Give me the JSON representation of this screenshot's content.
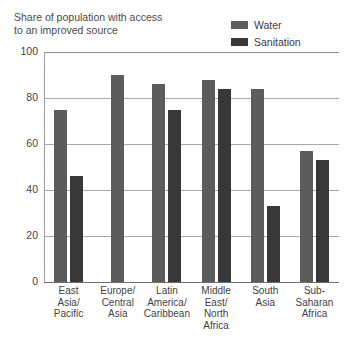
{
  "chart_data": {
    "type": "bar",
    "title": "Share of population with access\nto an improved source",
    "xlabel": "",
    "ylabel": "",
    "ylim": [
      0,
      100
    ],
    "yticks": [
      100,
      80,
      60,
      40,
      20,
      0
    ],
    "grid": true,
    "legend_position": "top-right",
    "categories": [
      "East\nAsia/\nPacific",
      "Europe/\nCentral\nAsia",
      "Latin\nAmerica/\nCaribbean",
      "Middle\nEast/\nNorth\nAfrica",
      "South\nAsia",
      "Sub-\nSaharan\nAfrica"
    ],
    "series": [
      {
        "name": "Water",
        "color": "#5c5c5c",
        "values": [
          75,
          90,
          86,
          88,
          84,
          57
        ]
      },
      {
        "name": "Sanitation",
        "color": "#383838",
        "values": [
          46,
          null,
          75,
          84,
          33,
          53
        ]
      }
    ]
  },
  "legend": {
    "items": [
      {
        "label": "Water",
        "color": "#5c5c5c"
      },
      {
        "label": "Sanitation",
        "color": "#383838"
      }
    ]
  }
}
